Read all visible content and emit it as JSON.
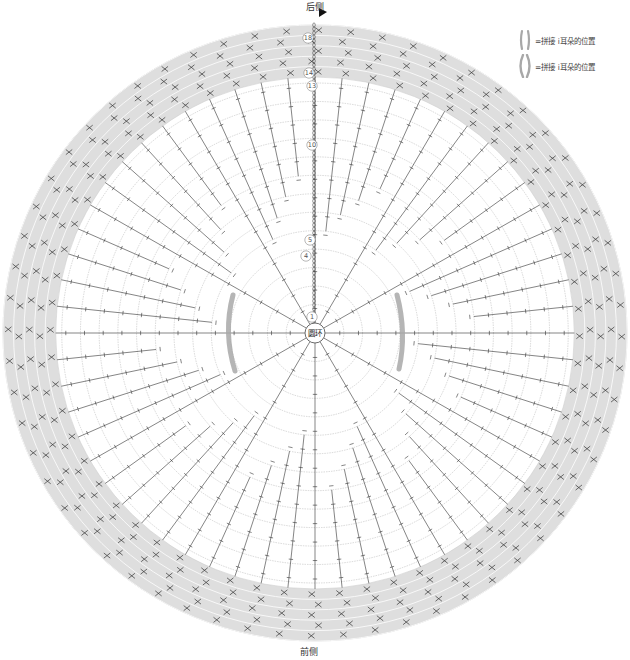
{
  "labels": {
    "back": "后侧",
    "front": "前侧",
    "center": "圆环"
  },
  "legend": [
    {
      "symbol": "ear-marker-narrow",
      "text": "=拼接 i耳朵的位置"
    },
    {
      "symbol": "ear-marker-wide",
      "text": "=拼接 i耳朵的位置"
    }
  ],
  "round_labels": [
    {
      "text": "1",
      "round": 1
    },
    {
      "text": "4",
      "round": 4
    },
    {
      "text": "5",
      "round": 5
    },
    {
      "text": "10",
      "round": 10
    },
    {
      "text": "13",
      "round": 13
    },
    {
      "text": "14",
      "round": 14
    },
    {
      "text": "18",
      "round": 18
    }
  ],
  "colors": {
    "band": "#dedede",
    "stitch": "#333333",
    "ring_line": "#aaaaaa",
    "ear_marker": "#a8a8a8",
    "start_marker": "#111111"
  },
  "geometry": {
    "cx": 315,
    "cy": 333,
    "outer_rx": 312,
    "outer_ry": 308,
    "band_inner_r": 256,
    "center_r": 10,
    "total_rounds": 18,
    "band_start_round": 14,
    "spokes": 60
  }
}
